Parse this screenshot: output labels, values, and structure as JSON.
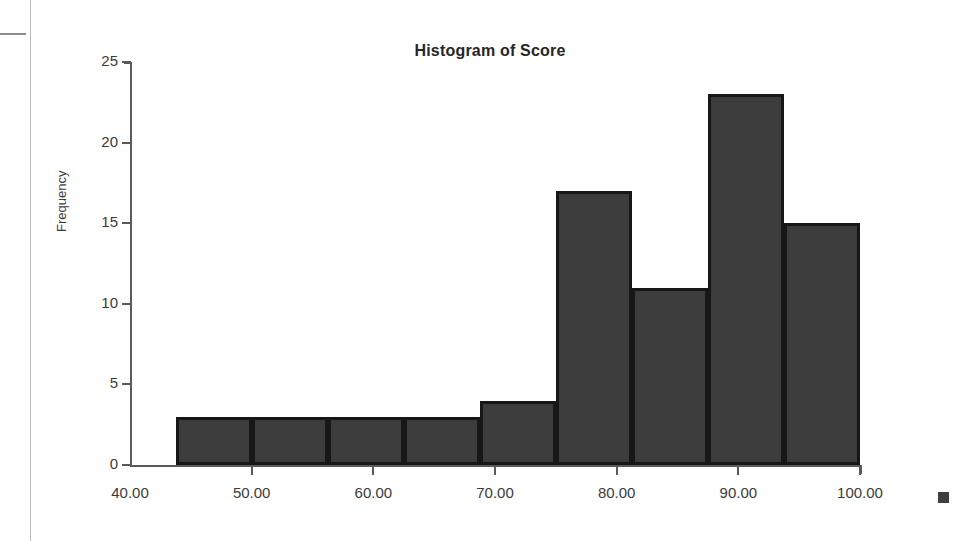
{
  "page": {
    "background_color": "#ffffff",
    "artifacts": [
      "page-edge-vertical-line",
      "page-edge-horizontal-mark"
    ]
  },
  "chart_data": {
    "type": "bar",
    "title": "Histogram of Score",
    "xlabel": "",
    "ylabel": "Frequency",
    "xlim": [
      40.0,
      100.0
    ],
    "ylim": [
      0,
      25
    ],
    "grid": false,
    "legend": "none",
    "bar_color": "#3c3c3c",
    "bar_edge_color": "#171717",
    "x_tick_labels": [
      "40.00",
      "50.00",
      "60.00",
      "70.00",
      "80.00",
      "90.00",
      "100.00"
    ],
    "x_tick_values": [
      40.0,
      50.0,
      60.0,
      70.0,
      80.0,
      90.0,
      100.0
    ],
    "y_tick_labels": [
      "0",
      "5",
      "10",
      "15",
      "20",
      "25"
    ],
    "y_tick_values": [
      0,
      5,
      10,
      15,
      20,
      25
    ],
    "bin_edges": [
      43.75,
      50.0,
      56.25,
      62.5,
      68.75,
      75.0,
      81.25,
      87.5,
      93.75,
      100.0
    ],
    "categories": [
      "43.75-50.00",
      "50.00-56.25",
      "56.25-62.50",
      "62.50-68.75",
      "68.75-75.00",
      "75.00-81.25",
      "81.25-87.50",
      "87.50-93.75",
      "93.75-100.00"
    ],
    "values": [
      3,
      3,
      3,
      3,
      4,
      17,
      11,
      23,
      15
    ],
    "bars": [
      {
        "label": "43.75-50.00",
        "value": 3
      },
      {
        "label": "50.00-56.25",
        "value": 3
      },
      {
        "label": "56.25-62.50",
        "value": 3
      },
      {
        "label": "62.50-68.75",
        "value": 3
      },
      {
        "label": "68.75-75.00",
        "value": 4
      },
      {
        "label": "75.00-81.25",
        "value": 17
      },
      {
        "label": "81.25-87.50",
        "value": 11
      },
      {
        "label": "87.50-93.75",
        "value": 23
      },
      {
        "label": "93.75-100.00",
        "value": 15
      }
    ]
  }
}
